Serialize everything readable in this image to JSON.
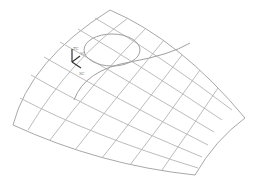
{
  "view": {
    "background": "#ffffff",
    "mesh_color": "#b4b4b4"
  },
  "triad": {
    "labels": {
      "z": "ZC",
      "y": "YC",
      "x": "XC"
    },
    "color": "#333333"
  },
  "surface": {
    "corners": {
      "top": [
        110,
        10
      ],
      "right": [
        245,
        118
      ],
      "bottom": [
        195,
        175
      ],
      "left": [
        13,
        125
      ]
    },
    "u_lines": 7,
    "v_lines": 7
  },
  "features": {
    "ellipse": {
      "cx": 112,
      "cy": 50,
      "rx": 28,
      "ry": 16
    },
    "curve": {
      "start": [
        74,
        100
      ],
      "end": [
        190,
        43
      ]
    }
  }
}
